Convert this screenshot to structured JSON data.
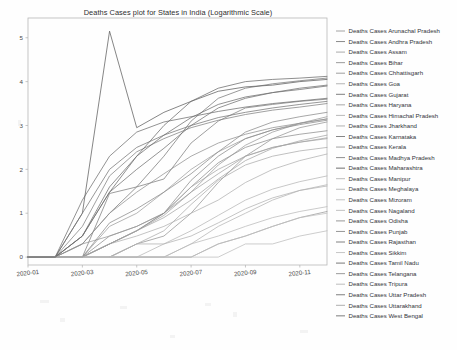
{
  "figure": {
    "title": "Deaths Cases plot for States in India (Logarithmic Scale)",
    "background_color": "#fefefe",
    "axes_color": "#b8b8b8"
  },
  "chart_data": {
    "type": "line",
    "title": "Deaths Cases plot for States in India (Logarithmic Scale)",
    "xlabel": "",
    "ylabel": "",
    "scale": "logarithmic",
    "grid": false,
    "legend_position": "right-outside",
    "xlim": [
      0,
      11
    ],
    "ylim": [
      -0.18,
      5.45
    ],
    "x_tick_labels": [
      "2020-01",
      "2020-03",
      "2020-05",
      "2020-07",
      "2020-09",
      "2020-11"
    ],
    "x_tick_values": [
      0,
      2,
      4,
      6,
      8,
      10
    ],
    "y_tick_labels": [
      "0",
      "1",
      "2",
      "3",
      "4",
      "5"
    ],
    "y_tick_values": [
      0,
      1,
      2,
      3,
      4,
      5
    ],
    "x": [
      0,
      1,
      2,
      3,
      4,
      5,
      6,
      7,
      8,
      9,
      10,
      11
    ],
    "series": [
      {
        "name": "Deaths Cases Arunachal Pradesh",
        "color": "#9a9a9a",
        "values": [
          0,
          0,
          0,
          0,
          0,
          0,
          0,
          0.3,
          0.48,
          0.7,
          0.9,
          1.04
        ]
      },
      {
        "name": "Deaths Cases Andhra Pradesh",
        "color": "#7d7d7d",
        "values": [
          0,
          0,
          0,
          1.45,
          1.6,
          1.78,
          2.6,
          3.1,
          3.4,
          3.48,
          3.55,
          3.6
        ]
      },
      {
        "name": "Deaths Cases Assam",
        "color": "#a2a2a2",
        "values": [
          0,
          0,
          0,
          0.3,
          0.6,
          0.95,
          1.48,
          1.9,
          2.3,
          2.5,
          2.62,
          2.7
        ]
      },
      {
        "name": "Deaths Cases Bihar",
        "color": "#8e8e8e",
        "values": [
          0,
          0,
          0,
          0.48,
          0.7,
          1.0,
          1.6,
          2.15,
          2.5,
          2.7,
          2.8,
          2.88
        ]
      },
      {
        "name": "Deaths Cases Chhattisgarh",
        "color": "#949494",
        "values": [
          0,
          0,
          0,
          0,
          0.3,
          0.48,
          1.0,
          1.7,
          2.3,
          2.7,
          2.95,
          3.08
        ]
      },
      {
        "name": "Deaths Cases Goa",
        "color": "#ababab",
        "values": [
          0,
          0,
          0,
          0,
          0.3,
          0.6,
          1.2,
          1.75,
          2.1,
          2.3,
          2.42,
          2.5
        ]
      },
      {
        "name": "Deaths Cases Gujarat",
        "color": "#6f6f6f",
        "values": [
          0,
          0,
          1.3,
          2.3,
          2.85,
          3.08,
          3.2,
          3.32,
          3.42,
          3.5,
          3.56,
          3.62
        ]
      },
      {
        "name": "Deaths Cases Haryana",
        "color": "#9d9d9d",
        "values": [
          0,
          0,
          0,
          0.7,
          1.0,
          1.48,
          2.0,
          2.4,
          2.7,
          2.9,
          3.05,
          3.15
        ]
      },
      {
        "name": "Deaths Cases Himachal Pradesh",
        "color": "#b0b0b0",
        "values": [
          0,
          0,
          0,
          0.3,
          0.48,
          0.7,
          1.0,
          1.3,
          1.7,
          2.0,
          2.2,
          2.35
        ]
      },
      {
        "name": "Deaths Cases Jharkhand",
        "color": "#a7a7a7",
        "values": [
          0,
          0,
          0,
          0.3,
          0.6,
          1.0,
          1.6,
          2.0,
          2.3,
          2.5,
          2.62,
          2.72
        ]
      },
      {
        "name": "Deaths Cases Karnataka",
        "color": "#787878",
        "values": [
          0,
          0,
          0.3,
          1.0,
          1.6,
          2.3,
          3.1,
          3.62,
          3.85,
          3.95,
          4.02,
          4.08
        ]
      },
      {
        "name": "Deaths Cases Kerala",
        "color": "#999999",
        "values": [
          0,
          0,
          0.3,
          0.48,
          0.7,
          1.0,
          1.48,
          2.1,
          2.55,
          2.85,
          3.05,
          3.2
        ]
      },
      {
        "name": "Deaths Cases Madhya Pradesh",
        "color": "#828282",
        "values": [
          0,
          0,
          0.7,
          1.85,
          2.4,
          2.7,
          2.95,
          3.12,
          3.25,
          3.35,
          3.42,
          3.5
        ]
      },
      {
        "name": "Deaths Cases Maharashtra",
        "color": "#5d5d5d",
        "values": [
          0,
          0,
          1.0,
          5.15,
          2.95,
          3.3,
          3.55,
          3.78,
          3.88,
          3.92,
          4.0,
          4.05
        ]
      },
      {
        "name": "Deaths Cases Manipur",
        "color": "#b4b4b4",
        "values": [
          0,
          0,
          0,
          0,
          0,
          0,
          0.3,
          0.7,
          1.0,
          1.3,
          1.52,
          1.65
        ]
      },
      {
        "name": "Deaths Cases Meghalaya",
        "color": "#b2b2b2",
        "values": [
          0,
          0,
          0,
          0,
          0.3,
          0.3,
          0.48,
          0.78,
          1.1,
          1.35,
          1.52,
          1.62
        ]
      },
      {
        "name": "Deaths Cases Mizoram",
        "color": "#bcbcbc",
        "values": [
          0,
          0,
          0,
          0,
          0,
          0,
          0,
          0,
          0.3,
          0.3,
          0.48,
          0.6
        ]
      },
      {
        "name": "Deaths Cases Nagaland",
        "color": "#bababa",
        "values": [
          0,
          0,
          0,
          0,
          0,
          0,
          0.3,
          0.48,
          0.7,
          0.9,
          1.04,
          1.15
        ]
      },
      {
        "name": "Deaths Cases Odisha",
        "color": "#8b8b8b",
        "values": [
          0,
          0,
          0,
          0.3,
          0.6,
          1.0,
          1.75,
          2.3,
          2.7,
          2.9,
          3.02,
          3.12
        ]
      },
      {
        "name": "Deaths Cases Punjab",
        "color": "#8a8a8a",
        "values": [
          0,
          0,
          0,
          0.78,
          1.1,
          1.48,
          1.9,
          2.4,
          2.85,
          3.08,
          3.2,
          3.3
        ]
      },
      {
        "name": "Deaths Cases Rajasthan",
        "color": "#757575",
        "values": [
          0,
          0,
          1.0,
          2.0,
          2.5,
          2.78,
          3.0,
          3.18,
          3.3,
          3.4,
          3.48,
          3.55
        ]
      },
      {
        "name": "Deaths Cases Sikkim",
        "color": "#c0c0c0",
        "values": [
          0,
          0,
          0,
          0,
          0,
          0,
          0,
          0.3,
          0.48,
          0.7,
          0.9,
          1.0
        ]
      },
      {
        "name": "Deaths Cases Tamil Nadu",
        "color": "#6a6a6a",
        "values": [
          0,
          0,
          0.48,
          1.48,
          2.3,
          3.0,
          3.55,
          3.85,
          4.0,
          4.05,
          4.08,
          4.12
        ]
      },
      {
        "name": "Deaths Cases Telangana",
        "color": "#909090",
        "values": [
          0,
          0,
          0.3,
          1.0,
          1.48,
          1.9,
          2.3,
          2.6,
          2.8,
          2.95,
          3.05,
          3.15
        ]
      },
      {
        "name": "Deaths Cases Tripura",
        "color": "#b6b6b6",
        "values": [
          0,
          0,
          0,
          0,
          0,
          0.3,
          0.6,
          0.95,
          1.3,
          1.55,
          1.72,
          1.85
        ]
      },
      {
        "name": "Deaths Cases Uttar Pradesh",
        "color": "#707070",
        "values": [
          0,
          0,
          0.48,
          1.48,
          2.0,
          2.48,
          3.0,
          3.4,
          3.62,
          3.75,
          3.85,
          3.92
        ]
      },
      {
        "name": "Deaths Cases Uttarakhand",
        "color": "#a5a5a5",
        "values": [
          0,
          0,
          0,
          0.3,
          0.6,
          0.9,
          1.3,
          1.78,
          2.2,
          2.48,
          2.65,
          2.78
        ]
      },
      {
        "name": "Deaths Cases West Bengal",
        "color": "#6d6d6d",
        "values": [
          0,
          0,
          0.48,
          1.6,
          2.3,
          2.78,
          3.18,
          3.48,
          3.65,
          3.75,
          3.82,
          3.9
        ]
      }
    ]
  }
}
